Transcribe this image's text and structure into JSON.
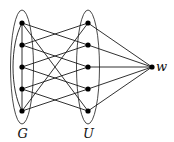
{
  "diagram": {
    "type": "graph",
    "groups": [
      {
        "id": "G",
        "label": "G",
        "nodes": [
          "g1",
          "g2",
          "g3",
          "g4",
          "g5"
        ]
      },
      {
        "id": "U",
        "label": "U",
        "nodes": [
          "u1",
          "u2",
          "u3",
          "u4",
          "u5"
        ]
      }
    ],
    "apex": {
      "id": "w",
      "label": "w"
    },
    "nodes": [
      {
        "id": "g1",
        "x": 22,
        "y": 23
      },
      {
        "id": "g2",
        "x": 22,
        "y": 45
      },
      {
        "id": "g3",
        "x": 22,
        "y": 67
      },
      {
        "id": "g4",
        "x": 22,
        "y": 89
      },
      {
        "id": "g5",
        "x": 22,
        "y": 111
      },
      {
        "id": "u1",
        "x": 88,
        "y": 23
      },
      {
        "id": "u2",
        "x": 88,
        "y": 45
      },
      {
        "id": "u3",
        "x": 88,
        "y": 67
      },
      {
        "id": "u4",
        "x": 88,
        "y": 89
      },
      {
        "id": "u5",
        "x": 88,
        "y": 111
      },
      {
        "id": "w",
        "x": 152,
        "y": 67
      }
    ],
    "edges": [
      [
        "g1",
        "g2"
      ],
      [
        "g2",
        "g3"
      ],
      [
        "g3",
        "g4"
      ],
      [
        "g4",
        "g5"
      ],
      [
        "g1",
        "g5"
      ],
      [
        "u1",
        "g2"
      ],
      [
        "u1",
        "g5"
      ],
      [
        "u2",
        "g1"
      ],
      [
        "u2",
        "g3"
      ],
      [
        "u3",
        "g2"
      ],
      [
        "u3",
        "g4"
      ],
      [
        "u4",
        "g3"
      ],
      [
        "u4",
        "g5"
      ],
      [
        "u5",
        "g4"
      ],
      [
        "u5",
        "g1"
      ],
      [
        "w",
        "u1"
      ],
      [
        "w",
        "u2"
      ],
      [
        "w",
        "u3"
      ],
      [
        "w",
        "u4"
      ],
      [
        "w",
        "u5"
      ]
    ],
    "labels": {
      "G": "G",
      "U": "U",
      "w": "w"
    }
  }
}
